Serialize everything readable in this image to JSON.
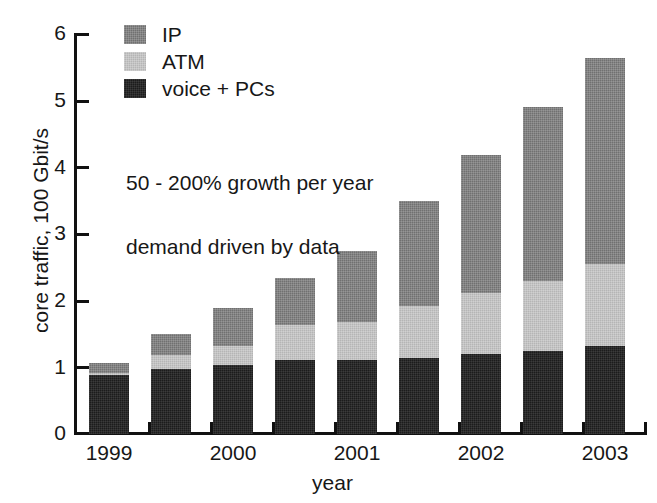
{
  "chart_data": {
    "type": "bar",
    "subtype": "stacked-bar",
    "title": "",
    "xlabel": "year",
    "ylabel": "core traffic, 100 Gbit/s",
    "ylim": [
      0,
      6
    ],
    "ytick_labels": [
      "0",
      "1",
      "2",
      "3",
      "4",
      "5",
      "6"
    ],
    "ytick_values": [
      0,
      1,
      2,
      3,
      4,
      5,
      6
    ],
    "xtick_labels": [
      "1999",
      "2000",
      "2001",
      "2002",
      "2003"
    ],
    "categories": [
      "1999",
      "1999.5",
      "2000",
      "2000.5",
      "2001",
      "2001.5",
      "2002",
      "2002.5",
      "2003"
    ],
    "grid": false,
    "legend_position": "top-left",
    "series": [
      {
        "name": "voice + PCs",
        "color": "#1c1c1c",
        "values": [
          0.88,
          0.97,
          1.03,
          1.1,
          1.1,
          1.14,
          1.2,
          1.24,
          1.32
        ]
      },
      {
        "name": "ATM",
        "color": "#b5b5b5",
        "values": [
          0.03,
          0.21,
          0.29,
          0.53,
          0.57,
          0.77,
          0.91,
          1.05,
          1.23
        ]
      },
      {
        "name": "IP",
        "color": "#707070",
        "values": [
          0.15,
          0.32,
          0.57,
          0.7,
          1.07,
          1.58,
          2.06,
          2.61,
          3.08
        ]
      }
    ],
    "totals": [
      1.06,
      1.5,
      1.89,
      2.33,
      2.74,
      3.49,
      4.17,
      4.9,
      5.63
    ],
    "annotations": [
      "50 - 200% growth per year",
      "demand driven by data"
    ]
  },
  "legend": {
    "items": [
      {
        "label": "IP",
        "swatch": "ip-swatch"
      },
      {
        "label": "ATM",
        "swatch": "atm-swatch"
      },
      {
        "label": "voice + PCs",
        "swatch": "voice-swatch"
      }
    ]
  },
  "axes": {
    "y_title": "core traffic, 100 Gbit/s",
    "x_title": "year",
    "y_ticks": [
      "6",
      "5",
      "4",
      "3",
      "2",
      "1",
      "0"
    ],
    "x_ticks": [
      "1999",
      "2000",
      "2001",
      "2002",
      "2003"
    ]
  },
  "annotations": {
    "growth": "50 - 200% growth per year",
    "demand": "demand driven by data"
  }
}
